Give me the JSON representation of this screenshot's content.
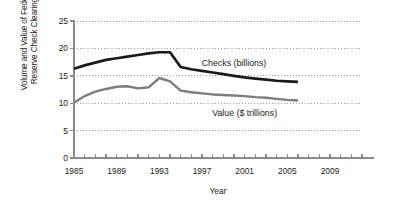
{
  "chart_data": {
    "type": "line",
    "title": "",
    "xlabel": "Year",
    "ylabel": "Volume and Value of Federal Reserve Check Clearings",
    "ylabel_line1": "Volume and Value of Federal",
    "ylabel_line2": "Reserve Check Clearings",
    "xlim": [
      1985,
      2012
    ],
    "ylim": [
      0,
      25
    ],
    "ytick_values": [
      0,
      5,
      10,
      15,
      20,
      25
    ],
    "ytick_labels": [
      "0",
      "5",
      "10",
      "15",
      "20",
      "25"
    ],
    "xtick_values": [
      1985,
      1986,
      1987,
      1988,
      1989,
      1990,
      1991,
      1992,
      1993,
      1994,
      1995,
      1996,
      1997,
      1998,
      1999,
      2000,
      2001,
      2002,
      2003,
      2004,
      2005,
      2006,
      2007,
      2008,
      2009,
      2010,
      2011,
      2012
    ],
    "xtick_labeled": [
      1985,
      1989,
      1993,
      1997,
      2001,
      2005,
      2009
    ],
    "xtick_labels": [
      "1985",
      "1989",
      "1993",
      "1997",
      "2001",
      "2005",
      "2009"
    ],
    "grid": true,
    "grid_style": "dotted",
    "grid_axis": "y",
    "legend_position": "inline-annotation",
    "series": [
      {
        "name": "Checks (billions)",
        "color": "#1a1a1a",
        "label_x": 2000,
        "label_y": 17.4,
        "x": [
          1985,
          1986,
          1987,
          1988,
          1989,
          1990,
          1991,
          1992,
          1993,
          1994,
          1995,
          1996,
          1997,
          1998,
          1999,
          2000,
          2001,
          2002,
          2003,
          2004,
          2005,
          2006
        ],
        "values": [
          16.3,
          16.9,
          17.4,
          17.9,
          18.2,
          18.5,
          18.8,
          19.1,
          19.3,
          19.3,
          16.6,
          16.2,
          15.9,
          15.6,
          15.3,
          15.0,
          14.7,
          14.5,
          14.3,
          14.1,
          14.0,
          13.9
        ]
      },
      {
        "name": "Value ($ trillions)",
        "color": "#7d7d7d",
        "label_x": 2001,
        "label_y": 8.3,
        "x": [
          1985,
          1986,
          1987,
          1988,
          1989,
          1990,
          1991,
          1992,
          1993,
          1994,
          1995,
          1996,
          1997,
          1998,
          1999,
          2000,
          2001,
          2002,
          2003,
          2004,
          2005,
          2006
        ],
        "values": [
          10.1,
          11.3,
          12.1,
          12.6,
          13.0,
          13.1,
          12.7,
          12.9,
          14.6,
          14.0,
          12.3,
          12.0,
          11.8,
          11.6,
          11.5,
          11.4,
          11.3,
          11.1,
          11.0,
          10.8,
          10.6,
          10.5
        ]
      }
    ]
  },
  "axes": {
    "axis_color": "#8a8a8a",
    "grid_color": "#9a9a9a",
    "text_color": "#1b1b1b"
  }
}
